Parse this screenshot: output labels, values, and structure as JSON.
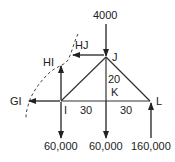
{
  "diagram": {
    "title": "",
    "nodes": {
      "I": {
        "label": "I",
        "x": 61,
        "y": 101
      },
      "J": {
        "label": "J",
        "x": 106,
        "y": 57
      },
      "K": {
        "label": "K",
        "x": 106,
        "y": 101
      },
      "L": {
        "label": "L",
        "x": 150,
        "y": 101
      }
    },
    "members": [
      {
        "from": "I",
        "to": "J"
      },
      {
        "from": "J",
        "to": "L"
      },
      {
        "from": "I",
        "to": "L"
      },
      {
        "from": "J",
        "to": "K"
      }
    ],
    "dimensions": {
      "IK": "30",
      "KL": "30",
      "JK": "20"
    },
    "loads": {
      "top_load": "4000",
      "load_at_I": "60,000",
      "load_at_K": "60,000",
      "reaction_at_L": "160,000"
    },
    "member_forces": {
      "HJ": "HJ",
      "HI": "HI",
      "GI": "GI"
    },
    "labels": {
      "node_I": "I",
      "node_J": "J",
      "node_K": "K",
      "node_L": "L"
    },
    "colors": {
      "line": "#333333",
      "text": "#222222",
      "background": "#ffffff"
    }
  }
}
